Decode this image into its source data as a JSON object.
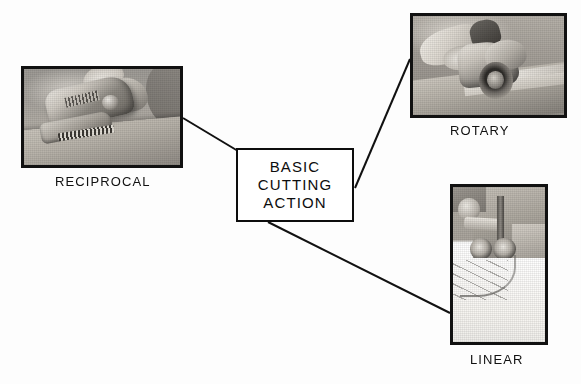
{
  "diagram": {
    "title": "Basic Cutting Action",
    "background_color": "#fdfdfd",
    "line_color": "#111111",
    "center_node": {
      "lines": [
        "BASIC",
        "CUTTING",
        "ACTION"
      ],
      "border_color": "#0d0d0d",
      "fill_color": "#ffffff"
    },
    "nodes": [
      {
        "id": "reciprocal",
        "caption": "RECIPROCAL",
        "photo_alt": "reciprocating saw cutting into a wooden board",
        "position": "top-left"
      },
      {
        "id": "rotary",
        "caption": "ROTARY",
        "photo_alt": "circular saw with rotating blade cutting a board",
        "position": "top-right"
      },
      {
        "id": "linear",
        "caption": "LINEAR",
        "photo_alt": "band saw machine with linear blade cutting a curved line",
        "position": "bottom-right"
      }
    ],
    "connectors": [
      {
        "from": "center_node",
        "to": "reciprocal"
      },
      {
        "from": "center_node",
        "to": "rotary"
      },
      {
        "from": "center_node",
        "to": "linear"
      }
    ]
  }
}
